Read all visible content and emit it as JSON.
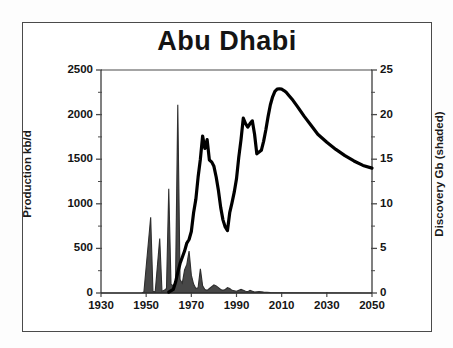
{
  "chart_data": {
    "type": "line",
    "title": "Abu Dhabi",
    "xlabel": "",
    "ylabel": "Production kb/d",
    "y2label": "Discovery Gb (shaded)",
    "xlim": [
      1930,
      2050
    ],
    "ylim": [
      0,
      2500
    ],
    "y2lim": [
      0,
      25
    ],
    "xticks": [
      1930,
      1950,
      1970,
      1990,
      2010,
      2030,
      2050
    ],
    "xtick_labels": [
      "1930",
      "1950",
      "1970",
      "1990",
      "2010",
      "2030",
      "2050"
    ],
    "yticks": [
      0,
      500,
      1000,
      1500,
      2000,
      2500
    ],
    "ytick_labels": [
      "0",
      "500",
      "1000",
      "1500",
      "2000",
      "2500"
    ],
    "y2ticks": [
      0,
      5,
      10,
      15,
      20,
      25
    ],
    "y2tick_labels": [
      "0",
      "5",
      "10",
      "15",
      "20",
      "25"
    ],
    "yminor_interval": 250,
    "y2minor_interval": 2.5,
    "grid": false,
    "legend": "none",
    "series": [
      {
        "name": "Production kb/d",
        "type": "line",
        "axis": "left",
        "color": "#000000",
        "linewidth": 3.2,
        "x": [
          1960,
          1962,
          1963,
          1964,
          1965,
          1966,
          1967,
          1968,
          1969,
          1970,
          1971,
          1972,
          1973,
          1974,
          1975,
          1976,
          1977,
          1978,
          1979,
          1980,
          1981,
          1982,
          1983,
          1984,
          1985,
          1986,
          1987,
          1988,
          1989,
          1990,
          1991,
          1992,
          1993,
          1994,
          1995,
          1996,
          1997,
          1998,
          1999,
          2000,
          2001,
          2002,
          2003,
          2004,
          2005,
          2006,
          2007,
          2008,
          2009,
          2010,
          2011,
          2012,
          2013,
          2015,
          2017,
          2020,
          2023,
          2026,
          2030,
          2034,
          2038,
          2042,
          2046,
          2050
        ],
        "y": [
          10,
          40,
          120,
          230,
          330,
          400,
          470,
          560,
          600,
          690,
          900,
          1050,
          1300,
          1500,
          1760,
          1620,
          1720,
          1490,
          1470,
          1420,
          1300,
          1150,
          960,
          820,
          740,
          700,
          900,
          1010,
          1130,
          1280,
          1520,
          1720,
          1960,
          1900,
          1860,
          1900,
          1930,
          1780,
          1560,
          1580,
          1600,
          1700,
          1830,
          1980,
          2110,
          2200,
          2260,
          2285,
          2290,
          2285,
          2270,
          2250,
          2220,
          2160,
          2090,
          1980,
          1880,
          1780,
          1690,
          1610,
          1540,
          1480,
          1430,
          1400
        ]
      },
      {
        "name": "Discovery Gb (shaded)",
        "type": "area",
        "axis": "right",
        "color": "#2e2e2e",
        "x": [
          1930,
          1948,
          1949,
          1952,
          1953,
          1954,
          1956,
          1957,
          1958,
          1959,
          1960,
          1961,
          1962,
          1963,
          1964,
          1965,
          1966,
          1967,
          1968,
          1969,
          1970,
          1971,
          1972,
          1973,
          1974,
          1975,
          1976,
          1977,
          1978,
          1979,
          1980,
          1981,
          1982,
          1983,
          1984,
          1985,
          1986,
          1987,
          1988,
          1990,
          1992,
          1993,
          1994,
          1995,
          1996,
          1997,
          1998,
          2000,
          2002,
          2005,
          2010,
          2050
        ],
        "y": [
          0,
          0,
          0.1,
          8.5,
          0.2,
          0.1,
          6.1,
          0.2,
          0.3,
          0.5,
          11.7,
          1.0,
          0.8,
          1.2,
          21.1,
          1.5,
          1.1,
          2.6,
          3.2,
          4.7,
          2.0,
          1.0,
          0.5,
          0.6,
          2.7,
          0.8,
          0.4,
          0.3,
          0.5,
          0.7,
          0.9,
          0.8,
          0.6,
          0.4,
          0.3,
          0.4,
          0.6,
          0.5,
          0.3,
          0.2,
          0.4,
          0.3,
          0.2,
          0.15,
          0.3,
          0.2,
          0.1,
          0.15,
          0.1,
          0.05,
          0.03,
          0.0
        ]
      }
    ]
  }
}
